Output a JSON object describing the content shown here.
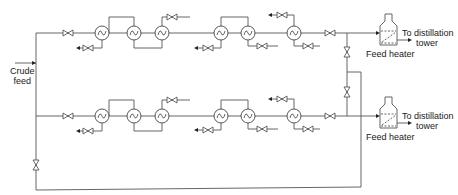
{
  "diagram": {
    "labels": {
      "crude_feed": [
        "Crude",
        "feed"
      ],
      "to_tower_top": [
        "To distillation",
        "tower"
      ],
      "to_tower_bottom": [
        "To distillation",
        "tower"
      ],
      "feed_heater_top": "Feed heater",
      "feed_heater_bottom": "Feed heater"
    },
    "trains": [
      {
        "name": "upper-train",
        "line_y": 33,
        "exchangers_x": [
          102,
          134,
          162,
          221,
          248,
          294
        ],
        "inlet_valve_x": 68,
        "outlet_valve_x": 330
      },
      {
        "name": "lower-train",
        "line_y": 116,
        "exchangers_x": [
          102,
          134,
          162,
          221,
          248,
          294
        ],
        "inlet_valve_x": 68,
        "outlet_valve_x": 330
      }
    ],
    "colors": {
      "line": "#555555",
      "text": "#222222",
      "background": "#ffffff"
    }
  }
}
